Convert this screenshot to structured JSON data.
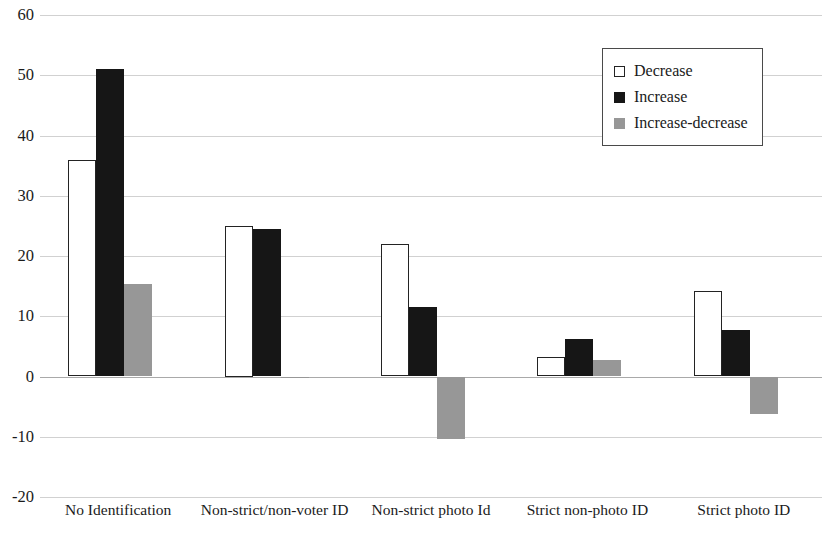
{
  "chart_data": {
    "type": "bar",
    "title": "",
    "xlabel": "",
    "ylabel": "",
    "ylim": [
      -20,
      60
    ],
    "yticks": [
      60,
      50,
      40,
      30,
      20,
      10,
      0,
      -10,
      -20
    ],
    "grid": true,
    "legend_position": "top-right",
    "categories": [
      "No Identification",
      "Non-strict/non-voter ID",
      "Non-strict photo Id",
      "Strict non-photo ID",
      "Strict photo ID"
    ],
    "series": [
      {
        "name": "Decrease",
        "color": "#ffffff",
        "values": [
          36.0,
          25.0,
          22.0,
          3.2,
          14.2
        ]
      },
      {
        "name": "Increase",
        "color": "#161616",
        "values": [
          51.1,
          24.5,
          11.5,
          6.2,
          7.8
        ]
      },
      {
        "name": "Increase-decrease",
        "color": "#979797",
        "values": [
          15.3,
          -0.3,
          -10.4,
          2.8,
          -6.2
        ]
      }
    ]
  },
  "legend": {
    "items": [
      {
        "label": "Decrease"
      },
      {
        "label": "Increase"
      },
      {
        "label": "Increase-decrease"
      }
    ]
  },
  "axis": {
    "y_tick_labels": [
      "60",
      "50",
      "40",
      "30",
      "20",
      "10",
      "0",
      "-10",
      "-20"
    ],
    "x_tick_labels": [
      "No Identification",
      "Non-strict/non-voter ID",
      "Non-strict photo Id",
      "Strict non-photo ID",
      "Strict photo ID"
    ]
  }
}
